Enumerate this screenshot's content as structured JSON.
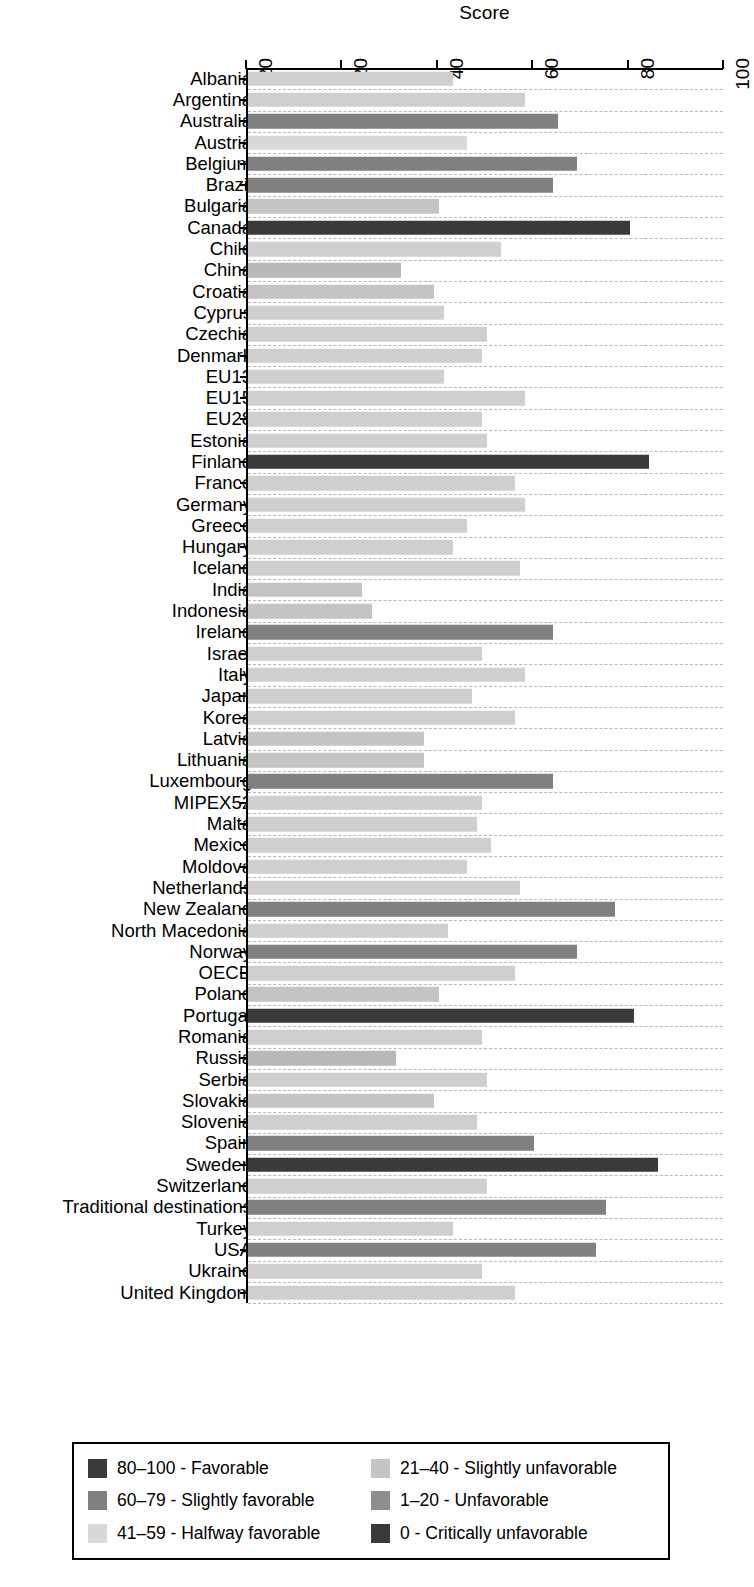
{
  "chart_data": {
    "type": "bar",
    "orientation": "horizontal",
    "title": "Score",
    "xlabel": "Score",
    "ylabel": "",
    "xlim": [
      0,
      100
    ],
    "grid": true,
    "axis_position": "top",
    "tick_labels": [
      "20",
      "20",
      "40",
      "60",
      "80",
      "100"
    ],
    "tick_values": [
      0,
      20,
      40,
      60,
      80,
      100
    ],
    "legend_position": "bottom",
    "categories": [
      "Albania",
      "Argentina",
      "Australia",
      "Austria",
      "Belgium",
      "Brazil",
      "Bulgaria",
      "Canada",
      "Chile",
      "China",
      "Croatia",
      "Cyprus",
      "Czechia",
      "Denmark",
      "EU13",
      "EU15",
      "EU28",
      "Estonia",
      "Finland",
      "France",
      "Germany",
      "Greece",
      "Hungary",
      "Iceland",
      "India",
      "Indonesia",
      "Ireland",
      "Israel",
      "Italy",
      "Japan",
      "Korea",
      "Latvia",
      "Lithuania",
      "Luxembourg",
      "MIPEX52",
      "Malta",
      "Mexico",
      "Moldova",
      "Netherlands",
      "New Zealand",
      "North Macedonia",
      "Norway",
      "OECD",
      "Poland",
      "Portugal",
      "Romania",
      "Russia",
      "Serbia",
      "Slovakia",
      "Slovenia",
      "Spain",
      "Sweden",
      "Switzerland",
      "Traditional destinations",
      "Turkey",
      "USA",
      "Ukraine",
      "United Kingdom"
    ],
    "values": [
      43,
      58,
      65,
      46,
      69,
      64,
      40,
      80,
      53,
      32,
      39,
      41,
      50,
      49,
      41,
      58,
      49,
      50,
      84,
      56,
      58,
      46,
      43,
      57,
      24,
      26,
      64,
      49,
      58,
      47,
      56,
      37,
      37,
      64,
      49,
      48,
      51,
      46,
      57,
      77,
      42,
      69,
      56,
      40,
      81,
      49,
      31,
      50,
      39,
      48,
      60,
      86,
      50,
      75,
      43,
      73,
      49,
      56
    ],
    "bar_colors": [
      "#cfcfcf",
      "#cfcfcf",
      "#808080",
      "#d8d8d8",
      "#808080",
      "#808080",
      "#c4c4c4",
      "#3a3a3a",
      "#cfcfcf",
      "#b8b8b8",
      "#c4c4c4",
      "#cfcfcf",
      "#cfcfcf",
      "#cfcfcf",
      "#cfcfcf",
      "#cfcfcf",
      "#cfcfcf",
      "#cfcfcf",
      "#3a3a3a",
      "#cfcfcf",
      "#cfcfcf",
      "#cfcfcf",
      "#cfcfcf",
      "#cfcfcf",
      "#c4c4c4",
      "#c4c4c4",
      "#808080",
      "#cfcfcf",
      "#cfcfcf",
      "#cfcfcf",
      "#cfcfcf",
      "#c4c4c4",
      "#c4c4c4",
      "#808080",
      "#cfcfcf",
      "#cfcfcf",
      "#cfcfcf",
      "#cfcfcf",
      "#cfcfcf",
      "#808080",
      "#cfcfcf",
      "#808080",
      "#cfcfcf",
      "#c4c4c4",
      "#3a3a3a",
      "#cfcfcf",
      "#b8b8b8",
      "#cfcfcf",
      "#c4c4c4",
      "#cfcfcf",
      "#808080",
      "#3a3a3a",
      "#cfcfcf",
      "#808080",
      "#cfcfcf",
      "#808080",
      "#cfcfcf",
      "#cfcfcf"
    ],
    "legend": [
      {
        "label": "80–100 - Favorable",
        "color": "#3a3a3a"
      },
      {
        "label": "21–40 - Slightly unfavorable",
        "color": "#c4c4c4"
      },
      {
        "label": "60–79 - Slightly favorable",
        "color": "#808080"
      },
      {
        "label": "1–20 - Unfavorable",
        "color": "#8d8d8d"
      },
      {
        "label": "41–59 - Halfway favorable",
        "color": "#d8d8d8"
      },
      {
        "label": "0 - Critically unfavorable",
        "color": "#3a3a3a"
      }
    ],
    "legend_order": [
      0,
      1,
      2,
      3,
      4,
      5
    ]
  },
  "axis": {
    "title": "Score"
  },
  "colors": {
    "favorable": "#3a3a3a",
    "slightly_favorable": "#808080",
    "halfway_favorable": "#d8d8d8",
    "slightly_unfavorable": "#c4c4c4",
    "unfavorable": "#8d8d8d",
    "critically_unfavorable": "#3a3a3a",
    "gridline": "#b9b9b9",
    "axis": "#000000",
    "background": "#ffffff"
  }
}
